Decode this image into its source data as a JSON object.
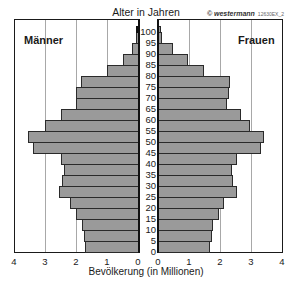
{
  "header": {
    "title": "Alter in Jahren",
    "copyright": "© westermann",
    "code": "12630EX_2"
  },
  "labels": {
    "left": "Männer",
    "right": "Frauen",
    "xlabel": "Bevölkerung (in Millionen)"
  },
  "colors": {
    "bar": "#9a9a9a",
    "bar_border": "#2a2a2a",
    "grid": "#a8a8a8",
    "axis": "#1a1a1a"
  },
  "chart_data": {
    "type": "bar",
    "subtype": "population-pyramid",
    "title": "Alter in Jahren",
    "xlabel": "Bevölkerung (in Millionen)",
    "ylabel": "Alter in Jahren",
    "xlim": [
      0,
      4
    ],
    "x_ticks_left": [
      "4",
      "3",
      "2",
      "1",
      "0"
    ],
    "x_ticks_right": [
      "0",
      "1",
      "2",
      "3",
      "4"
    ],
    "age_ticks": [
      "0",
      "5",
      "10",
      "15",
      "20",
      "25",
      "30",
      "35",
      "40",
      "45",
      "50",
      "55",
      "60",
      "65",
      "70",
      "75",
      "80",
      "85",
      "90",
      "95",
      "100"
    ],
    "grid": true,
    "categories": [
      "0-5",
      "5-10",
      "10-15",
      "15-20",
      "20-25",
      "25-30",
      "30-35",
      "35-40",
      "40-45",
      "45-50",
      "50-55",
      "55-60",
      "60-65",
      "65-70",
      "70-75",
      "75-80",
      "80-85",
      "85-90",
      "90-95",
      "95-100",
      "100+"
    ],
    "series": [
      {
        "name": "Männer",
        "side": "left",
        "values": [
          1.7,
          1.75,
          1.8,
          2.0,
          2.2,
          2.55,
          2.45,
          2.4,
          2.5,
          3.4,
          3.55,
          3.0,
          2.5,
          2.0,
          2.0,
          1.85,
          1.0,
          0.5,
          0.2,
          0.05,
          0.05
        ]
      },
      {
        "name": "Frauen",
        "side": "right",
        "values": [
          1.65,
          1.7,
          1.75,
          1.95,
          2.1,
          2.5,
          2.4,
          2.35,
          2.5,
          3.3,
          3.4,
          2.95,
          2.65,
          2.2,
          2.25,
          2.3,
          1.45,
          0.95,
          0.45,
          0.1,
          0.05
        ]
      }
    ]
  }
}
